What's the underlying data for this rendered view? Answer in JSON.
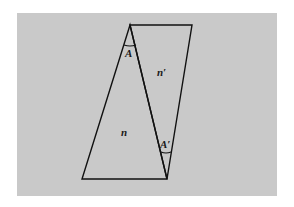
{
  "figure": {
    "background_color": "#c9c9c9",
    "line_color": "#111111",
    "labels": {
      "angle_apex": "A",
      "angle_apex_prime": "A′",
      "medium_n": "n",
      "medium_n_prime": "n′"
    },
    "shapes": {
      "prism_n": {
        "type": "triangle",
        "vertices": [
          [
            130,
            25
          ],
          [
            82,
            179
          ],
          [
            167,
            179
          ]
        ]
      },
      "prism_n_prime": {
        "type": "triangle",
        "vertices": [
          [
            130,
            25
          ],
          [
            192,
            25
          ],
          [
            167,
            179
          ]
        ]
      }
    }
  }
}
